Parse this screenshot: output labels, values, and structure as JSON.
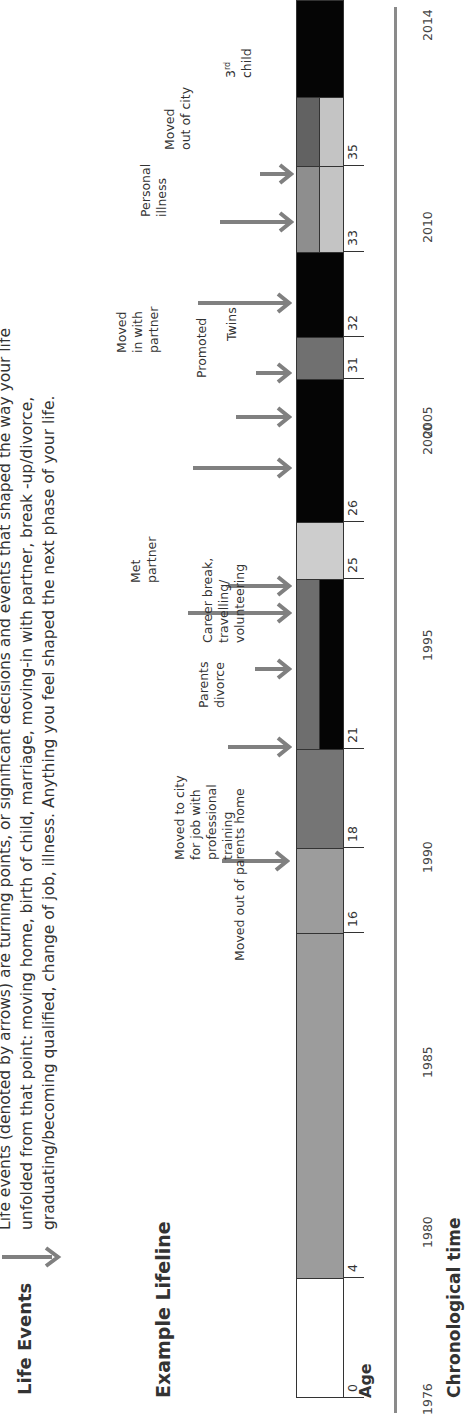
{
  "intro": {
    "legend_label": "Life Events",
    "lines": [
      "Life events (denoted by arrows) are turning points, or significant decisions and events that shaped the way your life",
      "unfolded from that point: moving home, birth of child, marriage, moving-in with partner, break -up/divorce,",
      "graduating/becoming qualified, change of job, illness. Anything you feel shaped the next phase of your life."
    ]
  },
  "lifeline_title": "Example Lifeline",
  "age_axis_label": "Age",
  "time_axis_label": "Chronological time",
  "colors": {
    "white": "#ffffff",
    "mid_grey": "#9a9a9a",
    "dark_grey": "#6e6e6e",
    "black": "#050505",
    "light_grey": "#c8c8c8",
    "arrow": "#808080"
  },
  "chart_data": {
    "type": "timeline",
    "title": "Example Lifeline",
    "xlabel_age": "Age",
    "xlabel_time": "Chronological time",
    "age_ticks": [
      0,
      4,
      16,
      18,
      21,
      25,
      26,
      31,
      32,
      33,
      35
    ],
    "year_ticks": [
      "1976",
      "1980",
      "1985",
      "1990",
      "1995",
      "2000",
      "2005",
      "2010",
      "2014"
    ],
    "segments": [
      {
        "from": 0,
        "to": 4,
        "top": "white",
        "bottom": "white"
      },
      {
        "from": 4,
        "to": 16,
        "top": "mid_grey",
        "bottom": "mid_grey"
      },
      {
        "from": 16,
        "to": 18,
        "top": "mid_grey",
        "bottom": "mid_grey"
      },
      {
        "from": 18,
        "to": 21,
        "top": "dark_grey",
        "bottom": "dark_grey"
      },
      {
        "from": 21,
        "to": 25,
        "top": "dark_grey",
        "bottom": "black"
      },
      {
        "from": 25,
        "to": 26,
        "top": "light_grey",
        "bottom": "light_grey"
      },
      {
        "from": 26,
        "to": 31,
        "top": "black",
        "bottom": "black"
      },
      {
        "from": 31,
        "to": 32,
        "top": "dark_grey",
        "bottom": "dark_grey"
      },
      {
        "from": 32,
        "to": 33,
        "top": "black",
        "bottom": "black"
      },
      {
        "from": 33,
        "to": 35,
        "top": "mid_grey",
        "bottom": "light_grey"
      },
      {
        "from": 35,
        "to": 36.6,
        "top": "dark_grey",
        "bottom": "light_grey"
      },
      {
        "from": 36.6,
        "to": 38.5,
        "top": "black",
        "bottom": "black"
      }
    ],
    "events": [
      {
        "age": 17.3,
        "label": "Moved out of parents home"
      },
      {
        "age": 21,
        "label": "Moved to city for job with professional training"
      },
      {
        "age": 22.7,
        "label": "Parents divorce"
      },
      {
        "age": 24.2,
        "label": "Met partner"
      },
      {
        "age": 24.8,
        "label": "Career break, travelling/volunteering"
      },
      {
        "age": 27.3,
        "label": "Moved in with partner"
      },
      {
        "age": 28.9,
        "label": "Promoted"
      },
      {
        "age": 31,
        "label": "Twins"
      },
      {
        "age": 32.4,
        "label": "Personal illness"
      },
      {
        "age": 33.8,
        "label": "Moved out of city"
      },
      {
        "age": 35,
        "label": "3rd child"
      }
    ]
  },
  "age_ticks": [
    {
      "label": "0",
      "x": 15
    },
    {
      "label": "4",
      "x": 135
    },
    {
      "label": "16",
      "x": 480
    },
    {
      "label": "18",
      "x": 565
    },
    {
      "label": "21",
      "x": 664
    },
    {
      "label": "25",
      "x": 834
    },
    {
      "label": "26",
      "x": 891
    },
    {
      "label": "31",
      "x": 1034
    },
    {
      "label": "32",
      "x": 1076
    },
    {
      "label": "33",
      "x": 1161
    },
    {
      "label": "35",
      "x": 1247
    }
  ],
  "year_ticks": [
    {
      "label": "1976",
      "x": -4
    },
    {
      "label": "1980",
      "x": 170
    },
    {
      "label": "1985",
      "x": 336
    },
    {
      "label": "1990",
      "x": 540
    },
    {
      "label": "1995",
      "x": 753
    },
    {
      "label": "2000",
      "x": 958
    },
    {
      "label": "2005",
      "x": 1161
    },
    {
      "label": "2010",
      "x": 1166
    },
    {
      "label": "2014",
      "x": 1370
    }
  ],
  "segments": [
    {
      "x1": 15,
      "x2": 135,
      "top": "#ffffff",
      "bottom": "#ffffff"
    },
    {
      "x1": 135,
      "x2": 480,
      "top": "#9c9c9c",
      "bottom": "#9c9c9c"
    },
    {
      "x1": 480,
      "x2": 565,
      "top": "#9c9c9c",
      "bottom": "#9c9c9c"
    },
    {
      "x1": 565,
      "x2": 664,
      "top": "#757575",
      "bottom": "#757575"
    },
    {
      "x1": 664,
      "x2": 834,
      "top": "#6e6e6e",
      "bottom": "#050505"
    },
    {
      "x1": 834,
      "x2": 891,
      "top": "#cdcdcd",
      "bottom": "#cdcdcd"
    },
    {
      "x1": 891,
      "x2": 1034,
      "top": "#050505",
      "bottom": "#050505"
    },
    {
      "x1": 1034,
      "x2": 1076,
      "top": "#707070",
      "bottom": "#707070"
    },
    {
      "x1": 1076,
      "x2": 1161,
      "top": "#050505",
      "bottom": "#050505"
    },
    {
      "x1": 1161,
      "x2": 1247,
      "top": "#8e8e8e",
      "bottom": "#c4c4c4"
    },
    {
      "x1": 1247,
      "x2": 1316,
      "top": "#626262",
      "bottom": "#c4c4c4"
    },
    {
      "x1": 1316,
      "x2": 1413,
      "top": "#050505",
      "bottom": "#050505"
    }
  ],
  "events": [
    {
      "label_lines": [
        "Moved out of parents home"
      ],
      "arrow_x": 552,
      "arrow_y1": 222,
      "arrow_y2": 288,
      "label_x": 452,
      "label_y": 232,
      "rot": true
    },
    {
      "label_lines": [
        "Moved to city",
        "for job with",
        "professional",
        "training"
      ],
      "arrow_x": 666,
      "arrow_y1": 228,
      "arrow_y2": 290,
      "label_x": 666,
      "label_y": 160
    },
    {
      "label_lines": [
        "Parents",
        "divorce"
      ],
      "arrow_x": 744,
      "arrow_y1": 255,
      "arrow_y2": 290,
      "label_x": 748,
      "label_y": 196
    },
    {
      "label_lines": [
        "Met",
        "partner"
      ],
      "arrow_x": 800,
      "arrow_y1": 188,
      "arrow_y2": 290,
      "label_x": 805,
      "label_y": 128
    },
    {
      "label_lines": [
        "Career break,",
        "travelling/",
        "volunteering"
      ],
      "arrow_x": 827,
      "arrow_y1": 228,
      "arrow_y2": 290,
      "label_x": 880,
      "label_y": 200
    },
    {
      "label_lines": [
        "Moved",
        "in with",
        "partner"
      ],
      "arrow_x": 945,
      "arrow_y1": 193,
      "arrow_y2": 290,
      "label_x": 945,
      "label_y": 115
    },
    {
      "label_lines": [
        "Promoted"
      ],
      "arrow_x": 996,
      "arrow_y1": 236,
      "arrow_y2": 290,
      "label_x": 1000,
      "label_y": 195
    },
    {
      "label_lines": [
        "Twins"
      ],
      "arrow_x": 1040,
      "arrow_y1": 256,
      "arrow_y2": 290,
      "label_x": 1050,
      "label_y": 225
    },
    {
      "label_lines": [
        "Personal",
        "illness"
      ],
      "arrow_x": 1110,
      "arrow_y1": 198,
      "arrow_y2": 290,
      "label_x": 1115,
      "label_y": 138
    },
    {
      "label_lines": [
        "Moved",
        "out of city"
      ],
      "arrow_x": 1191,
      "arrow_y1": 220,
      "arrow_y2": 292,
      "label_x": 1196,
      "label_y": 164
    },
    {
      "label_lines": [
        "3rd",
        "child"
      ],
      "arrow_x": 1239,
      "arrow_y1": 260,
      "arrow_y2": 292,
      "label_x": 1250,
      "label_y": 222
    }
  ]
}
